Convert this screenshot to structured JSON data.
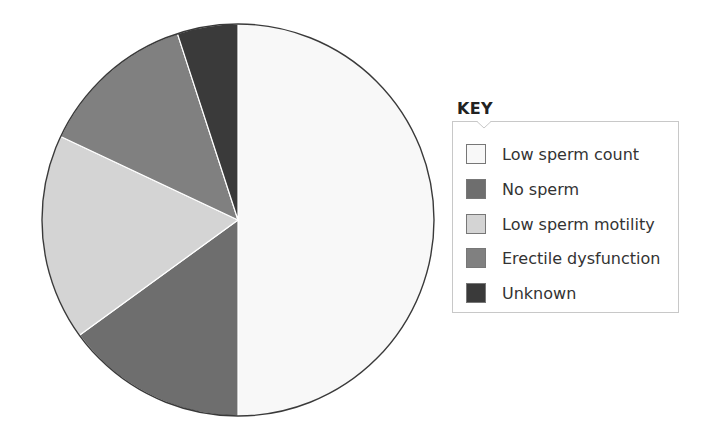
{
  "chart_data": {
    "type": "pie",
    "title": "",
    "categories": [
      "Low sperm count",
      "No sperm",
      "Low sperm motility",
      "Erectile dysfunction",
      "Unknown"
    ],
    "values": [
      50,
      15,
      17,
      13,
      5
    ],
    "colors": [
      "#f8f8f8",
      "#6e6e6e",
      "#d4d4d4",
      "#808080",
      "#3a3a3a"
    ],
    "start_angle_deg": 0,
    "direction": "clockwise",
    "legend": {
      "title": "KEY",
      "position": "right",
      "entries": [
        "Low sperm count",
        "No sperm",
        "Low sperm motility",
        "Erectile dysfunction",
        "Unknown"
      ]
    }
  },
  "legend": {
    "title": "KEY",
    "items": [
      {
        "label": "Low sperm count",
        "color": "#f8f8f8"
      },
      {
        "label": "No sperm",
        "color": "#6e6e6e"
      },
      {
        "label": "Low sperm motility",
        "color": "#d4d4d4"
      },
      {
        "label": "Erectile dysfunction",
        "color": "#808080"
      },
      {
        "label": "Unknown",
        "color": "#3a3a3a"
      }
    ]
  }
}
